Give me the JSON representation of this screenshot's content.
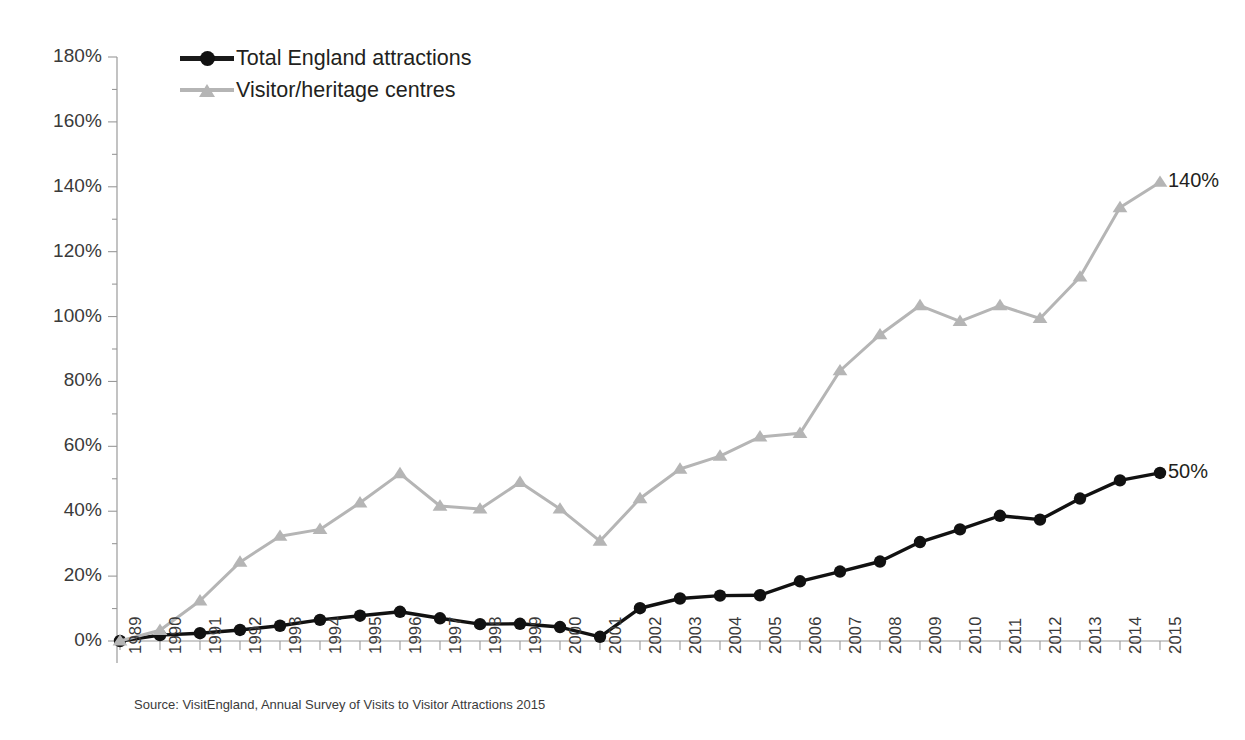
{
  "chart_data": {
    "type": "line",
    "title": "",
    "subtitle": "",
    "xlabel": "",
    "ylabel": "",
    "xlim": [
      1989,
      2015
    ],
    "ylim": [
      0,
      180
    ],
    "y_tick_step": 20,
    "y_minor_step": 10,
    "grid": false,
    "legend_position": "top-left",
    "y_tick_labels": [
      "0%",
      "20%",
      "40%",
      "60%",
      "80%",
      "100%",
      "120%",
      "140%",
      "160%",
      "180%"
    ],
    "y_tick_values": [
      0,
      20,
      40,
      60,
      80,
      100,
      120,
      140,
      160,
      180
    ],
    "categories": [
      "1989",
      "1990",
      "1991",
      "1992",
      "1993",
      "1994",
      "1995",
      "1996",
      "1997",
      "1998",
      "1999",
      "2000",
      "2001",
      "2002",
      "2003",
      "2004",
      "2005",
      "2006",
      "2007",
      "2008",
      "2009",
      "2010",
      "2011",
      "2012",
      "2013",
      "2014",
      "2015"
    ],
    "x": [
      1989,
      1990,
      1991,
      1992,
      1993,
      1994,
      1995,
      1996,
      1997,
      1998,
      1999,
      2000,
      2001,
      2002,
      2003,
      2004,
      2005,
      2006,
      2007,
      2008,
      2009,
      2010,
      2011,
      2012,
      2013,
      2014,
      2015
    ],
    "series": [
      {
        "name": "Total England attractions",
        "color": "#111111",
        "marker": "circle",
        "end_label": "50%",
        "values": [
          0.0,
          1.8,
          2.4,
          3.4,
          4.7,
          6.5,
          7.8,
          9.0,
          7.0,
          5.2,
          5.3,
          4.3,
          1.3,
          10.1,
          13.1,
          14.0,
          14.1,
          18.4,
          21.4,
          24.5,
          30.5,
          34.4,
          38.6,
          37.4,
          43.9,
          49.5,
          51.8
        ]
      },
      {
        "name": "Visitor/heritage centres",
        "color": "#b5b5b5",
        "marker": "triangle",
        "end_label": "140%",
        "values": [
          0.0,
          3.3,
          12.4,
          24.3,
          32.3,
          34.4,
          42.6,
          51.6,
          41.6,
          40.7,
          48.9,
          40.7,
          30.8,
          43.9,
          53.0,
          57.0,
          62.9,
          64.0,
          83.3,
          94.4,
          103.4,
          98.5,
          103.4,
          99.4,
          112.2,
          133.6,
          141.4
        ]
      }
    ],
    "annotations": [
      {
        "text": "140%",
        "series": "Visitor/heritage centres",
        "at": "2015"
      },
      {
        "text": "50%",
        "series": "Total England attractions",
        "at": "2015"
      }
    ],
    "source": "Source: VisitEngland, Annual Survey of Visits to Visitor Attractions 2015"
  },
  "legend": {
    "items": [
      {
        "label": "Total England attractions",
        "marker": "circle-marker",
        "color": "#111111"
      },
      {
        "label": "Visitor/heritage centres",
        "marker": "triangle-marker",
        "color": "#b5b5b5"
      }
    ]
  },
  "footer": {
    "source": "Source: VisitEngland, Annual Survey of Visits to Visitor Attractions 2015"
  }
}
